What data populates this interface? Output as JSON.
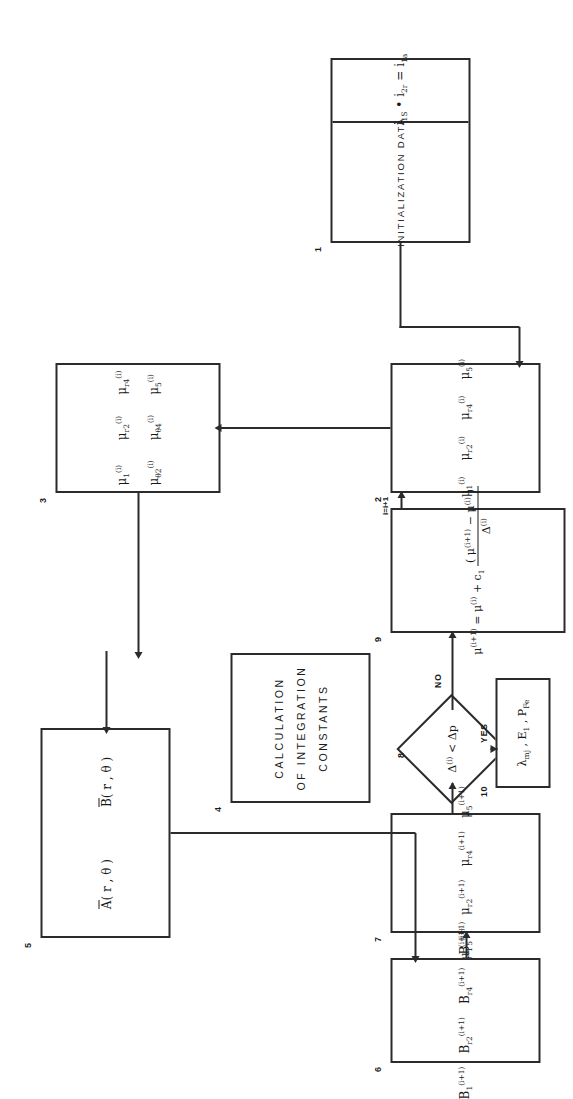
{
  "figure": {
    "type": "flowchart",
    "orientation": "rotated-90-ccw",
    "background": "#ffffff",
    "ink": "#2b2b2b"
  },
  "nodes": [
    {
      "id": "1",
      "number": "1",
      "shape": "rect-split",
      "left_label": "INITIALIZATION  DATA",
      "right_expr": "i₁S · i₂r = i₁a",
      "right_expr_parts": {
        "a": "i",
        "a_sub": "1S",
        "op1": "•",
        "b": "i",
        "b_sub": "2r",
        "eq": "=",
        "c": "i",
        "c_sub": "1a"
      }
    },
    {
      "id": "2",
      "number": "2",
      "shape": "rect",
      "items": [
        "μ₁⁽ⁱ⁾",
        "μ r2 ⁽ⁱ⁾",
        "μ r4 ⁽ⁱ⁾",
        "μ₅⁽ⁱ⁾"
      ],
      "items_parts": [
        {
          "base": "μ",
          "sub": "1",
          "sup": "(i)"
        },
        {
          "base": "μ",
          "sub": "r2",
          "sup": "(i)"
        },
        {
          "base": "μ",
          "sub": "r4",
          "sup": "(i)"
        },
        {
          "base": "μ",
          "sub": "5",
          "sup": "(i)"
        }
      ]
    },
    {
      "id": "3",
      "number": "3",
      "shape": "rect",
      "items_parts": [
        {
          "base": "μ",
          "sub": "1",
          "sup": "(i)"
        },
        {
          "base": "μ",
          "sub": "r2",
          "sup": "(i)"
        },
        {
          "base": "μ",
          "sub": "r4",
          "sup": "(i)"
        },
        {
          "base": "μ",
          "sub": "θ2",
          "sup": "(i)"
        },
        {
          "base": "μ",
          "sub": "θ4",
          "sup": "(i)"
        },
        {
          "base": "μ",
          "sub": "5",
          "sup": "(i)"
        }
      ]
    },
    {
      "id": "4",
      "number": "4",
      "shape": "rect",
      "lines": [
        "CALCULATION",
        "OF INTEGRATION",
        "CONSTANTS"
      ]
    },
    {
      "id": "5",
      "number": "5",
      "shape": "rect",
      "items_parts": [
        {
          "base": "A",
          "overbar": true,
          "args": "(r , θ )"
        },
        {
          "base": "B",
          "overbar": true,
          "args": "(r , θ )"
        }
      ]
    },
    {
      "id": "6",
      "number": "6",
      "shape": "rect",
      "items_parts": [
        {
          "base": "B",
          "sub": "1",
          "sup": "(i+1)"
        },
        {
          "base": "B",
          "sub": "r2",
          "sup": "(i+1)"
        },
        {
          "base": "B",
          "sub": "r4",
          "sup": "(i+1)"
        },
        {
          "base": "B",
          "sub": "5",
          "sup": "(i+1)"
        }
      ]
    },
    {
      "id": "7",
      "number": "7",
      "shape": "rect",
      "items_parts": [
        {
          "base": "μ",
          "sub": "1",
          "sup": "(i+1)"
        },
        {
          "base": "μ",
          "sub": "r2",
          "sup": "(i+1)"
        },
        {
          "base": "μ",
          "sub": "r4",
          "sup": "(i+1)"
        },
        {
          "base": "μ",
          "sub": "5",
          "sup": "(i+1)"
        }
      ]
    },
    {
      "id": "8",
      "number": "8",
      "shape": "diamond",
      "condition_left": "Δ",
      "condition_left_sup": "(i)",
      "condition_op": "<",
      "condition_right": "Δp"
    },
    {
      "id": "9",
      "number": "9",
      "shape": "rect",
      "equation": {
        "lhs_base": "μ",
        "lhs_sup": "(i+1)",
        "eq": "=",
        "t1_base": "μ",
        "t1_sup": "(i)",
        "plus": "+",
        "c": "c₁",
        "open": "(",
        "t2_base": "μ",
        "t2_sup": "(i+1)",
        "minus": "−",
        "t3_base": "μ",
        "t3_sup": "(i)",
        "close": ")",
        "denominator_base": "Δ",
        "denominator_sup": "(i)"
      }
    },
    {
      "id": "10",
      "number": "10",
      "shape": "rect",
      "outputs": "λ mj , E 1 , P Fe",
      "outputs_parts": [
        {
          "base": "λ",
          "sub": "mj"
        },
        {
          "base": "E",
          "sub": "1"
        },
        {
          "base": "P",
          "sub": "Fe"
        }
      ]
    }
  ],
  "edge_labels": {
    "yes": "YES",
    "no": "NO",
    "iteration": "i=i+1"
  }
}
